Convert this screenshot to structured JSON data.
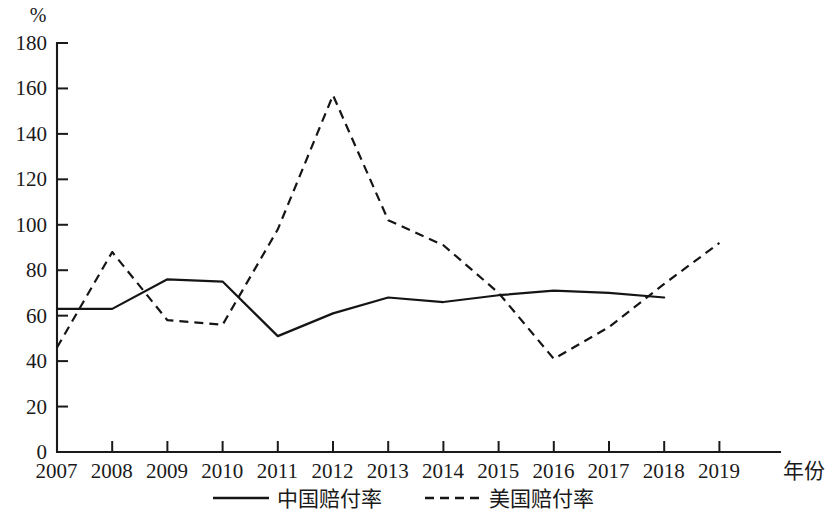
{
  "chart_data": {
    "type": "line",
    "title": "",
    "xlabel": "年份",
    "ylabel": "%",
    "x": [
      2007,
      2008,
      2009,
      2010,
      2011,
      2012,
      2013,
      2014,
      2015,
      2016,
      2017,
      2018,
      2019
    ],
    "categories": [
      "2007",
      "2008",
      "2009",
      "2010",
      "2011",
      "2012",
      "2013",
      "2014",
      "2015",
      "2016",
      "2017",
      "2018",
      "2019"
    ],
    "ylim": [
      0,
      180
    ],
    "ytick_values": [
      0,
      20,
      40,
      60,
      80,
      100,
      120,
      140,
      160,
      180
    ],
    "ytick_labels": [
      "0",
      "20",
      "40",
      "60",
      "80",
      "100",
      "120",
      "140",
      "160",
      "180"
    ],
    "grid": false,
    "legend_position": "bottom",
    "series": [
      {
        "name": "中国赔付率",
        "style": "solid",
        "color": "#151515",
        "x": [
          2007,
          2008,
          2009,
          2010,
          2011,
          2012,
          2013,
          2014,
          2015,
          2016,
          2017,
          2018
        ],
        "values": [
          63,
          63,
          76,
          75,
          51,
          61,
          68,
          66,
          69,
          71,
          70,
          68
        ]
      },
      {
        "name": "美国赔付率",
        "style": "dashed",
        "color": "#151515",
        "x": [
          2007,
          2008,
          2009,
          2010,
          2011,
          2012,
          2013,
          2014,
          2015,
          2016,
          2017,
          2018,
          2019
        ],
        "values": [
          46,
          88,
          58,
          56,
          98,
          157,
          102,
          91,
          70,
          41,
          55,
          74,
          92
        ]
      }
    ]
  },
  "axes": {
    "y_unit_label": "%",
    "x_axis_title": "年份"
  },
  "legend": {
    "items": [
      {
        "label": "中国赔付率",
        "style": "solid"
      },
      {
        "label": "美国赔付率",
        "style": "dashed"
      }
    ]
  }
}
